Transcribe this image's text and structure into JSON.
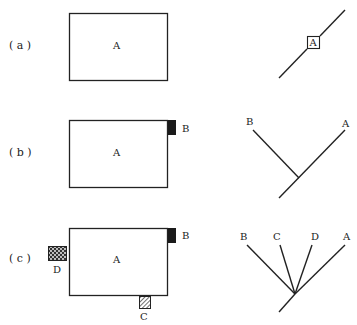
{
  "panels": [
    {
      "id": "a",
      "row_label": "( a )",
      "main_box_label": "A",
      "attachments": [],
      "tree": {
        "type": "single-line",
        "node_box_label": "A",
        "leaves": []
      }
    },
    {
      "id": "b",
      "row_label": "( b )",
      "main_box_label": "A",
      "attachments": [
        {
          "label": "B",
          "position": "top-right edge",
          "fill": "solid-black"
        }
      ],
      "tree": {
        "type": "branching",
        "leaves": [
          "B",
          "A"
        ]
      }
    },
    {
      "id": "c",
      "row_label": "( c )",
      "main_box_label": "A",
      "attachments": [
        {
          "label": "B",
          "position": "top-right edge",
          "fill": "solid-black"
        },
        {
          "label": "D",
          "position": "left edge",
          "fill": "dotted-pattern"
        },
        {
          "label": "C",
          "position": "bottom edge",
          "fill": "hatched"
        }
      ],
      "tree": {
        "type": "branching",
        "leaves": [
          "B",
          "C",
          "D",
          "A"
        ]
      }
    }
  ],
  "colors": {
    "stroke": "#222222",
    "background": "#ffffff",
    "tab_fill": "#1a1a1a"
  }
}
